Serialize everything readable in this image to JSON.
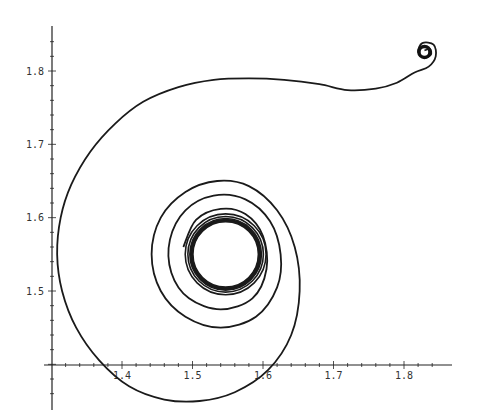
{
  "chart_data": {
    "type": "line",
    "title": "",
    "xlabel": "",
    "ylabel": "",
    "xlim": [
      1.3,
      1.87
    ],
    "ylim": [
      1.33,
      1.86
    ],
    "axes_origin": {
      "x": 1.3,
      "y": 1.4
    },
    "x_ticks": [
      "1.4",
      "1.5",
      "1.6",
      "1.7",
      "1.8"
    ],
    "y_ticks": [
      "1.5",
      "1.6",
      "1.7",
      "1.8"
    ],
    "grid": false,
    "legend": null,
    "series": [
      {
        "name": "trajectory",
        "color": "#1a1a1a",
        "points": [
          [
            1.829,
            1.828
          ],
          [
            1.837,
            1.83
          ],
          [
            1.838,
            1.822
          ],
          [
            1.829,
            1.818
          ],
          [
            1.82,
            1.826
          ],
          [
            1.826,
            1.838
          ],
          [
            1.842,
            1.836
          ],
          [
            1.845,
            1.82
          ],
          [
            1.835,
            1.806
          ],
          [
            1.815,
            1.798
          ],
          [
            1.79,
            1.784
          ],
          [
            1.76,
            1.776
          ],
          [
            1.72,
            1.774
          ],
          [
            1.68,
            1.782
          ],
          [
            1.63,
            1.788
          ],
          [
            1.58,
            1.79
          ],
          [
            1.53,
            1.788
          ],
          [
            1.48,
            1.778
          ],
          [
            1.43,
            1.758
          ],
          [
            1.39,
            1.728
          ],
          [
            1.355,
            1.69
          ],
          [
            1.328,
            1.645
          ],
          [
            1.313,
            1.6
          ],
          [
            1.308,
            1.55
          ],
          [
            1.315,
            1.5
          ],
          [
            1.335,
            1.45
          ],
          [
            1.368,
            1.405
          ],
          [
            1.41,
            1.37
          ],
          [
            1.46,
            1.352
          ],
          [
            1.51,
            1.35
          ],
          [
            1.56,
            1.362
          ],
          [
            1.607,
            1.392
          ],
          [
            1.64,
            1.44
          ],
          [
            1.652,
            1.5
          ],
          [
            1.645,
            1.56
          ],
          [
            1.62,
            1.61
          ],
          [
            1.58,
            1.643
          ],
          [
            1.535,
            1.65
          ],
          [
            1.49,
            1.635
          ],
          [
            1.455,
            1.6
          ],
          [
            1.442,
            1.55
          ],
          [
            1.455,
            1.5
          ],
          [
            1.49,
            1.465
          ],
          [
            1.54,
            1.45
          ],
          [
            1.59,
            1.465
          ],
          [
            1.62,
            1.505
          ],
          [
            1.625,
            1.55
          ],
          [
            1.61,
            1.595
          ],
          [
            1.575,
            1.625
          ],
          [
            1.53,
            1.63
          ],
          [
            1.49,
            1.61
          ],
          [
            1.468,
            1.57
          ],
          [
            1.47,
            1.525
          ],
          [
            1.495,
            1.49
          ],
          [
            1.54,
            1.475
          ],
          [
            1.585,
            1.49
          ],
          [
            1.605,
            1.53
          ],
          [
            1.6,
            1.575
          ],
          [
            1.575,
            1.605
          ],
          [
            1.54,
            1.612
          ],
          [
            1.505,
            1.597
          ],
          [
            1.487,
            1.56
          ]
        ]
      }
    ],
    "limit_cycle": {
      "center": [
        1.547,
        1.55
      ],
      "radius": 0.047
    }
  }
}
